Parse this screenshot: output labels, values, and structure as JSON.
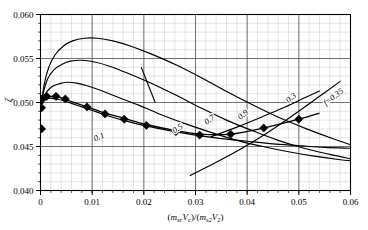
{
  "chart_data": {
    "type": "line",
    "title": "",
    "xlabel": "(m_sc V_c)/(m_s2 V_2)",
    "xlabel_parts": {
      "open1": "(",
      "m1": "m",
      "m1sub": "sc",
      "v1": "V",
      "v1sub": "c",
      "close1": ")/(",
      "m2": "m",
      "m2sub": "s2",
      "v2": "V",
      "v2sub": "2",
      "close2": ")"
    },
    "ylabel": "ζ",
    "xlim": [
      0,
      0.06
    ],
    "ylim": [
      0.04,
      0.06
    ],
    "xticks": [
      0,
      0.01,
      0.02,
      0.03,
      0.04,
      0.05,
      0.06
    ],
    "xticklabels": [
      "0",
      "0.01",
      "0.02",
      "0.03",
      "0.04",
      "0.05",
      "0.06"
    ],
    "yticks": [
      0.04,
      0.045,
      0.05,
      0.055,
      0.06
    ],
    "yticklabels": [
      "0.040",
      "0.045",
      "0.050",
      "0.055",
      "0.060"
    ],
    "xminor_step": 0.002,
    "yminor_step": 0.001,
    "grid": true,
    "legend": "none",
    "series": [
      {
        "name": "0.1",
        "label": "0.1",
        "label_x": 0.0115,
        "label_y": 0.0458,
        "label_rotation": -22,
        "points": [
          [
            0.0,
            0.0492
          ],
          [
            0.0004,
            0.0499
          ],
          [
            0.001,
            0.0503
          ],
          [
            0.0018,
            0.0505
          ],
          [
            0.003,
            0.0504
          ],
          [
            0.0045,
            0.0502
          ],
          [
            0.006,
            0.0499
          ],
          [
            0.008,
            0.0495
          ],
          [
            0.01,
            0.0491
          ],
          [
            0.013,
            0.0485
          ],
          [
            0.016,
            0.048
          ],
          [
            0.02,
            0.0474
          ],
          [
            0.025,
            0.0468
          ],
          [
            0.03,
            0.0463
          ],
          [
            0.035,
            0.0459
          ],
          [
            0.04,
            0.0456
          ],
          [
            0.045,
            0.0453
          ],
          [
            0.05,
            0.0451
          ],
          [
            0.055,
            0.0449
          ],
          [
            0.06,
            0.0448
          ]
        ]
      },
      {
        "name": "0.5",
        "label": "0.5",
        "label_x": 0.0268,
        "label_y": 0.0468,
        "label_rotation": -32,
        "points": [
          [
            0.0,
            0.0492
          ],
          [
            0.0005,
            0.0504
          ],
          [
            0.0012,
            0.0512
          ],
          [
            0.0022,
            0.0518
          ],
          [
            0.0035,
            0.0521
          ],
          [
            0.005,
            0.0523
          ],
          [
            0.007,
            0.0522
          ],
          [
            0.009,
            0.0519
          ],
          [
            0.012,
            0.0513
          ],
          [
            0.015,
            0.0506
          ],
          [
            0.019,
            0.0497
          ],
          [
            0.023,
            0.0487
          ],
          [
            0.028,
            0.0476
          ],
          [
            0.033,
            0.0466
          ],
          [
            0.038,
            0.0457
          ],
          [
            0.043,
            0.045
          ],
          [
            0.048,
            0.0444
          ],
          [
            0.053,
            0.0439
          ],
          [
            0.058,
            0.0435
          ],
          [
            0.06,
            0.0434
          ]
        ]
      },
      {
        "name": "0.7",
        "label": "0.7",
        "label_x": 0.033,
        "label_y": 0.0478,
        "label_rotation": -36,
        "points": [
          [
            0.0,
            0.0492
          ],
          [
            0.0006,
            0.0512
          ],
          [
            0.0014,
            0.0527
          ],
          [
            0.0026,
            0.0537
          ],
          [
            0.004,
            0.0543
          ],
          [
            0.0058,
            0.0547
          ],
          [
            0.008,
            0.0548
          ],
          [
            0.0105,
            0.0546
          ],
          [
            0.0135,
            0.0541
          ],
          [
            0.017,
            0.0533
          ],
          [
            0.021,
            0.0523
          ],
          [
            0.026,
            0.0509
          ],
          [
            0.031,
            0.0494
          ],
          [
            0.036,
            0.048
          ],
          [
            0.041,
            0.0468
          ],
          [
            0.046,
            0.0457
          ],
          [
            0.051,
            0.0448
          ],
          [
            0.056,
            0.0441
          ],
          [
            0.06,
            0.0436
          ]
        ]
      },
      {
        "name": "0.9",
        "label": "0.9",
        "label_x": 0.0395,
        "label_y": 0.0484,
        "label_rotation": -40,
        "points": [
          [
            0.0,
            0.0492
          ],
          [
            0.0007,
            0.052
          ],
          [
            0.0016,
            0.054
          ],
          [
            0.0028,
            0.0554
          ],
          [
            0.0044,
            0.0564
          ],
          [
            0.0062,
            0.057
          ],
          [
            0.0085,
            0.0573
          ],
          [
            0.011,
            0.0573
          ],
          [
            0.014,
            0.057
          ],
          [
            0.0175,
            0.0564
          ],
          [
            0.0215,
            0.0555
          ],
          [
            0.0265,
            0.0542
          ],
          [
            0.0315,
            0.0527
          ],
          [
            0.0365,
            0.0511
          ],
          [
            0.0415,
            0.0496
          ],
          [
            0.0465,
            0.0482
          ],
          [
            0.0515,
            0.047
          ],
          [
            0.0565,
            0.0459
          ],
          [
            0.06,
            0.0452
          ]
        ]
      },
      {
        "name": "0.3",
        "label": "0.3",
        "label_x": 0.0488,
        "label_y": 0.0503,
        "label_rotation": -38,
        "points": [
          [
            0.033,
            0.0461
          ],
          [
            0.038,
            0.0472
          ],
          [
            0.043,
            0.0484
          ],
          [
            0.047,
            0.0494
          ],
          [
            0.051,
            0.0505
          ],
          [
            0.054,
            0.0513
          ]
        ]
      },
      {
        "name": "f=0.35",
        "label": "f=0.35",
        "label_x": 0.057,
        "label_y": 0.0504,
        "label_rotation": -38,
        "points": [
          [
            0.029,
            0.0417
          ],
          [
            0.034,
            0.0432
          ],
          [
            0.039,
            0.0448
          ],
          [
            0.044,
            0.0466
          ],
          [
            0.049,
            0.0486
          ],
          [
            0.054,
            0.0507
          ],
          [
            0.058,
            0.0524
          ]
        ]
      }
    ],
    "markers": {
      "name": "data-markers",
      "style": "filled-diamond",
      "points": [
        [
          0.0002,
          0.0504
        ],
        [
          0.0002,
          0.0494
        ],
        [
          0.0002,
          0.047
        ],
        [
          0.0012,
          0.0507
        ],
        [
          0.003,
          0.0507
        ],
        [
          0.0048,
          0.0504
        ],
        [
          0.009,
          0.0495
        ],
        [
          0.0125,
          0.0487
        ],
        [
          0.0162,
          0.0481
        ],
        [
          0.0205,
          0.0474
        ],
        [
          0.0262,
          0.0467
        ],
        [
          0.0308,
          0.0463
        ],
        [
          0.0368,
          0.0464
        ],
        [
          0.0432,
          0.0471
        ],
        [
          0.05,
          0.0481
        ]
      ]
    },
    "marker_trend": {
      "points": [
        [
          0.0002,
          0.0505
        ],
        [
          0.0015,
          0.0507
        ],
        [
          0.0035,
          0.0506
        ],
        [
          0.006,
          0.0501
        ],
        [
          0.009,
          0.0495
        ],
        [
          0.0125,
          0.0488
        ],
        [
          0.0162,
          0.0482
        ],
        [
          0.0205,
          0.0475
        ],
        [
          0.0262,
          0.0468
        ],
        [
          0.031,
          0.0464
        ],
        [
          0.0368,
          0.0464
        ],
        [
          0.0432,
          0.0471
        ],
        [
          0.05,
          0.0481
        ],
        [
          0.054,
          0.0488
        ]
      ]
    },
    "tick_marker_segment": {
      "name": "short-diagonal-tick",
      "from": [
        0.0195,
        0.054
      ],
      "to": [
        0.0222,
        0.05
      ]
    }
  }
}
